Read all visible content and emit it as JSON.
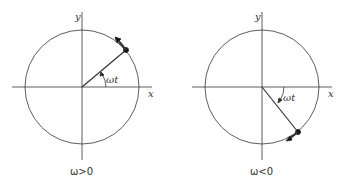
{
  "left": {
    "axis_x": "x",
    "axis_y": "y",
    "angle": "ωt",
    "caption": "ω>0"
  },
  "right": {
    "axis_x": "x",
    "axis_y": "y",
    "angle": "ωt",
    "caption": "ω<0"
  },
  "colors": {
    "line": "#333333",
    "background": "#ffffff"
  }
}
